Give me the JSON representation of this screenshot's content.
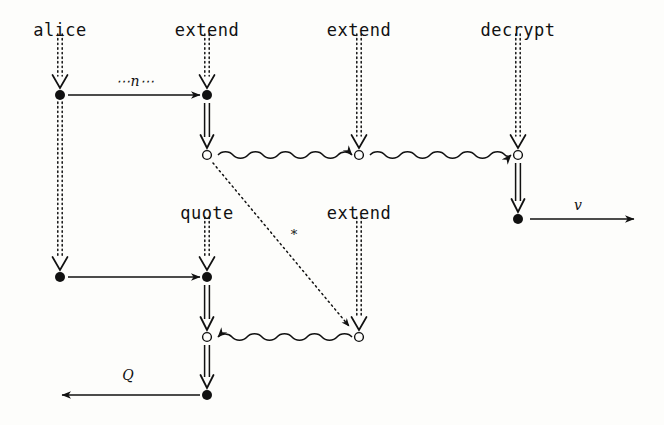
{
  "figure": {
    "type": "string-diagram",
    "width": 664,
    "height": 425,
    "background_color": "#fdfdfb",
    "ink_color": "#111111"
  },
  "node_labels": [
    {
      "id": "alice",
      "text": "alice",
      "x": 60,
      "y": 22
    },
    {
      "id": "extend-top-2",
      "text": "extend",
      "x": 207,
      "y": 22
    },
    {
      "id": "extend-top-3",
      "text": "extend",
      "x": 359,
      "y": 22
    },
    {
      "id": "decrypt-top-4",
      "text": "decrypt",
      "x": 518,
      "y": 22
    },
    {
      "id": "quote-mid-2",
      "text": "quote",
      "x": 207,
      "y": 205
    },
    {
      "id": "extend-mid-3",
      "text": "extend",
      "x": 359,
      "y": 205
    }
  ],
  "edge_labels": [
    {
      "id": "n-label",
      "text": "⋯n⋯",
      "x": 135,
      "y": 81,
      "style": "italic"
    },
    {
      "id": "star-label",
      "text": "*",
      "x": 294,
      "y": 234,
      "style": "upright"
    },
    {
      "id": "v-label",
      "text": "v",
      "x": 578,
      "y": 205,
      "style": "italic"
    },
    {
      "id": "q-label",
      "text": "Q",
      "x": 128,
      "y": 375,
      "style": "italic"
    }
  ],
  "nodes": [
    {
      "id": "n-alice-r1",
      "kind": "filled",
      "x": 60,
      "y": 95
    },
    {
      "id": "n-extend-r1",
      "kind": "filled",
      "x": 207,
      "y": 95
    },
    {
      "id": "n-extend-r2",
      "kind": "open",
      "x": 207,
      "y": 155
    },
    {
      "id": "n-extend3-r2",
      "kind": "open",
      "x": 359,
      "y": 155
    },
    {
      "id": "n-decrypt-r2",
      "kind": "open",
      "x": 518,
      "y": 155
    },
    {
      "id": "n-decrypt-r3",
      "kind": "filled",
      "x": 518,
      "y": 219
    },
    {
      "id": "n-alice-r3",
      "kind": "filled",
      "x": 60,
      "y": 277
    },
    {
      "id": "n-quote-r3",
      "kind": "filled",
      "x": 207,
      "y": 277
    },
    {
      "id": "n-quote-r4",
      "kind": "open",
      "x": 207,
      "y": 337
    },
    {
      "id": "n-extend3-r4",
      "kind": "open",
      "x": 359,
      "y": 337
    },
    {
      "id": "n-quote-r5",
      "kind": "filled",
      "x": 207,
      "y": 395
    }
  ],
  "edges": [
    {
      "id": "e-alice-entry",
      "kind": "dotted-double-vertical",
      "x": 60,
      "y1": 34,
      "y2": 88
    },
    {
      "id": "e-extend2-entry",
      "kind": "dotted-double-vertical",
      "x": 207,
      "y1": 34,
      "y2": 88
    },
    {
      "id": "e-extend3-entry",
      "kind": "dotted-double-vertical",
      "x": 359,
      "y1": 34,
      "y2": 148
    },
    {
      "id": "e-decrypt-entry",
      "kind": "dotted-double-vertical",
      "x": 518,
      "y1": 34,
      "y2": 148
    },
    {
      "id": "e-alice-spine",
      "kind": "dotted-double-vertical",
      "x": 60,
      "y1": 102,
      "y2": 270
    },
    {
      "id": "e-quote-entry",
      "kind": "dotted-double-vertical",
      "x": 207,
      "y1": 217,
      "y2": 270
    },
    {
      "id": "e-extend3-mid",
      "kind": "dotted-double-vertical",
      "x": 359,
      "y1": 217,
      "y2": 330
    },
    {
      "id": "e-n-arrow",
      "kind": "solid-right",
      "x1": 68,
      "x2": 200,
      "y": 95
    },
    {
      "id": "e-extend2-down",
      "kind": "double-vertical",
      "x": 207,
      "y1": 103,
      "y2": 148
    },
    {
      "id": "e-decrypt-down",
      "kind": "double-vertical",
      "x": 518,
      "y1": 163,
      "y2": 212
    },
    {
      "id": "e-quote-down-1",
      "kind": "double-vertical",
      "x": 207,
      "y1": 285,
      "y2": 330
    },
    {
      "id": "e-quote-down-2",
      "kind": "double-vertical",
      "x": 207,
      "y1": 345,
      "y2": 388
    },
    {
      "id": "e-squig-2-3",
      "kind": "squiggle-right",
      "x1": 218,
      "x2": 352,
      "y": 155
    },
    {
      "id": "e-squig-3-4",
      "kind": "squiggle-right",
      "x1": 370,
      "x2": 511,
      "y": 155
    },
    {
      "id": "e-squig-back",
      "kind": "squiggle-left",
      "x1": 352,
      "x2": 218,
      "y": 337
    },
    {
      "id": "e-alice-to-quote",
      "kind": "solid-right",
      "x1": 68,
      "x2": 200,
      "y": 277
    },
    {
      "id": "e-v-arrow",
      "kind": "solid-right",
      "x1": 530,
      "x2": 634,
      "y": 219
    },
    {
      "id": "e-q-arrow",
      "kind": "solid-left",
      "x1": 200,
      "x2": 62,
      "y": 395
    },
    {
      "id": "e-star-diagonal",
      "kind": "dotted-diagonal",
      "x1": 213,
      "y1": 163,
      "x2": 349,
      "y2": 326
    }
  ]
}
